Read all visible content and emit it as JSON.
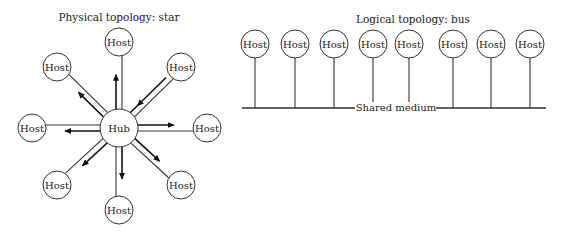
{
  "physical": {
    "title": "Physical topology: star",
    "hub": {
      "label": "Hub",
      "x": 119,
      "y": 128,
      "r": 19
    },
    "hosts": [
      {
        "label": "Host",
        "x": 119,
        "y": 42
      },
      {
        "label": "Host",
        "x": 181,
        "y": 67
      },
      {
        "label": "Host",
        "x": 207,
        "y": 128
      },
      {
        "label": "Host",
        "x": 181,
        "y": 185
      },
      {
        "label": "Host",
        "x": 119,
        "y": 210
      },
      {
        "label": "Host",
        "x": 57,
        "y": 185
      },
      {
        "label": "Host",
        "x": 32,
        "y": 128
      },
      {
        "label": "Host",
        "x": 57,
        "y": 67
      }
    ]
  },
  "logical": {
    "title": "Logical topology: bus",
    "medium_label": "Shared medium",
    "bus_y": 108,
    "hosts": [
      {
        "label": "Host",
        "x": 255
      },
      {
        "label": "Host",
        "x": 295
      },
      {
        "label": "Host",
        "x": 334
      },
      {
        "label": "Host",
        "x": 373
      },
      {
        "label": "Host",
        "x": 409
      },
      {
        "label": "Host",
        "x": 453
      },
      {
        "label": "Host",
        "x": 491
      },
      {
        "label": "Host",
        "x": 530
      }
    ],
    "host_y": 44
  }
}
